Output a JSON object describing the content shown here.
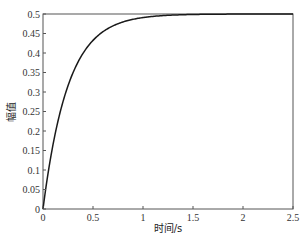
{
  "chart_data": {
    "type": "line",
    "title": "",
    "xlabel": "时间/s",
    "ylabel": "幅值",
    "xlim": [
      0,
      2.5
    ],
    "ylim": [
      0,
      0.5
    ],
    "grid": false,
    "legend": null,
    "x_ticks": [
      "0",
      "0.5",
      "1",
      "1.5",
      "2",
      "2.5"
    ],
    "y_ticks": [
      "0",
      "0.05",
      "0.1",
      "0.15",
      "0.2",
      "0.25",
      "0.3",
      "0.35",
      "0.4",
      "0.45",
      "0.5"
    ],
    "series": [
      {
        "name": "step response",
        "color": "#1a1a1a",
        "x": [
          0,
          0.1,
          0.2,
          0.3,
          0.4,
          0.5,
          0.6,
          0.7,
          0.8,
          0.9,
          1.0,
          1.2,
          1.4,
          1.6,
          1.8,
          2.0,
          2.25,
          2.5
        ],
        "y": [
          0,
          0.165,
          0.275,
          0.349,
          0.399,
          0.432,
          0.455,
          0.47,
          0.48,
          0.486,
          0.491,
          0.496,
          0.498,
          0.499,
          0.5,
          0.5,
          0.5,
          0.5
        ]
      }
    ]
  }
}
